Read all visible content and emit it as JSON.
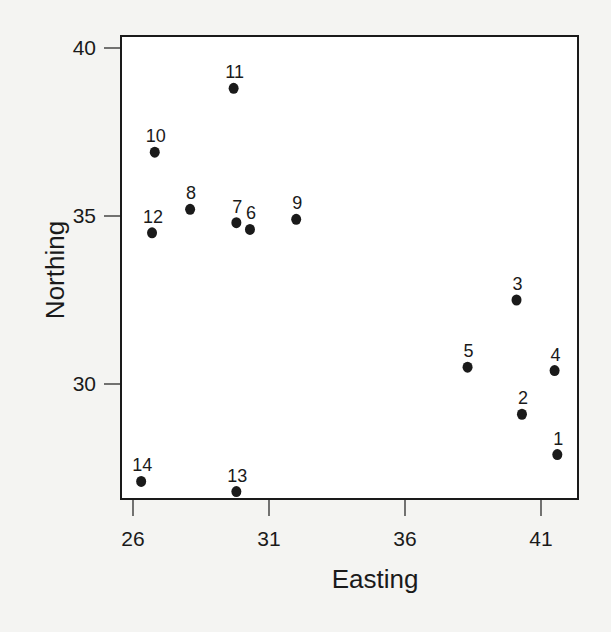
{
  "chart_data": {
    "type": "scatter",
    "title": "",
    "xlabel": "Easting",
    "ylabel": "Northing",
    "xlim": [
      25.6,
      42.9
    ],
    "ylim": [
      26.2,
      40.0
    ],
    "xticks": [
      26,
      31,
      36,
      41
    ],
    "yticks": [
      30,
      35,
      40
    ],
    "grid": false,
    "legend": null,
    "points": [
      {
        "label": "1",
        "x": 41.6,
        "y": 27.9
      },
      {
        "label": "2",
        "x": 40.3,
        "y": 29.1
      },
      {
        "label": "3",
        "x": 40.1,
        "y": 32.5
      },
      {
        "label": "4",
        "x": 41.5,
        "y": 30.4
      },
      {
        "label": "5",
        "x": 38.3,
        "y": 30.5
      },
      {
        "label": "6",
        "x": 30.3,
        "y": 34.6
      },
      {
        "label": "7",
        "x": 29.8,
        "y": 34.8
      },
      {
        "label": "8",
        "x": 28.1,
        "y": 35.2
      },
      {
        "label": "9",
        "x": 32.0,
        "y": 34.9
      },
      {
        "label": "10",
        "x": 26.8,
        "y": 36.9
      },
      {
        "label": "11",
        "x": 29.7,
        "y": 38.8
      },
      {
        "label": "12",
        "x": 26.7,
        "y": 34.5
      },
      {
        "label": "13",
        "x": 29.8,
        "y": 26.8
      },
      {
        "label": "14",
        "x": 26.3,
        "y": 27.1
      }
    ]
  },
  "colors": {
    "ink": "#1a1a1a",
    "background": "#f4f4f2",
    "plot_bg": "#ffffff"
  }
}
